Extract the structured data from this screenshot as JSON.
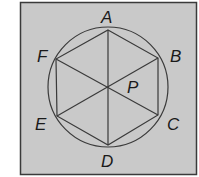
{
  "diagram": {
    "background_color": "#c9c9c9",
    "border_color": "#3a3a3a",
    "line_color": "#3a3a3a",
    "labels": {
      "A": "A",
      "B": "B",
      "C": "C",
      "D": "D",
      "E": "E",
      "F": "F",
      "P": "P"
    },
    "vertices": {
      "A": [
        108,
        30
      ],
      "B": [
        158,
        58
      ],
      "C": [
        158,
        115
      ],
      "D": [
        108,
        145
      ],
      "E": [
        57,
        116
      ],
      "F": [
        56,
        59
      ]
    },
    "center": [
      108,
      87
    ],
    "radius": 60
  }
}
